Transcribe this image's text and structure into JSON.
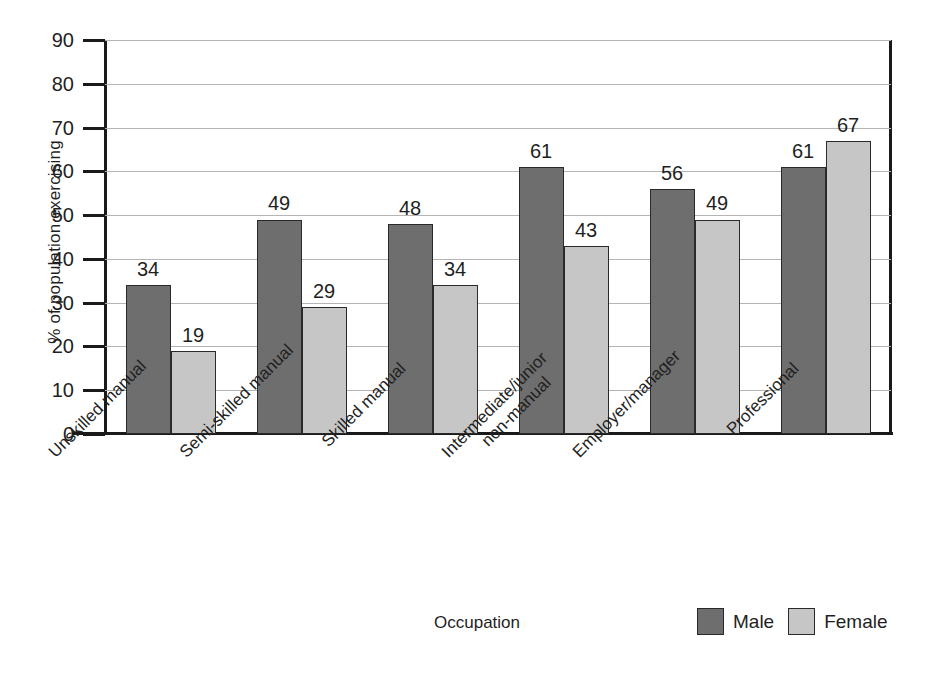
{
  "chart_data": {
    "type": "bar",
    "title": "",
    "xlabel": "Occupation",
    "ylabel": "% of population exercising",
    "categories": [
      "Unskilled manual",
      "Semi-skilled manual",
      "Skilled manual",
      "Intermediate/junior\nnon-manual",
      "Employer/manager",
      "Professional"
    ],
    "category_lines": [
      [
        "Unskilled manual"
      ],
      [
        "Semi-skilled manual"
      ],
      [
        "Skilled manual"
      ],
      [
        "Intermediate/junior",
        "non-manual"
      ],
      [
        "Employer/manager"
      ],
      [
        "Professional"
      ]
    ],
    "series": [
      {
        "name": "Male",
        "color": "#6e6e6e",
        "values": [
          34,
          49,
          48,
          61,
          56,
          61
        ]
      },
      {
        "name": "Female",
        "color": "#c6c6c6",
        "values": [
          19,
          29,
          34,
          43,
          49,
          67
        ]
      }
    ],
    "ylim": [
      0,
      90
    ],
    "yticks": [
      0,
      10,
      20,
      30,
      40,
      50,
      60,
      70,
      80,
      90
    ],
    "ytick_labels": [
      "0",
      "10",
      "20",
      "30",
      "40",
      "50",
      "60",
      "70",
      "80",
      "90"
    ],
    "grid": true,
    "legend_position": "bottom-right",
    "legend_entries": [
      "Male",
      "Female"
    ]
  },
  "axes": {
    "y_title": "% of population exercising",
    "x_title": "Occupation"
  },
  "colors": {
    "male": "#6e6e6e",
    "female": "#c6c6c6",
    "gridline": "#b4b4b4",
    "axis": "#1a1a1a",
    "background": "#ffffff"
  }
}
